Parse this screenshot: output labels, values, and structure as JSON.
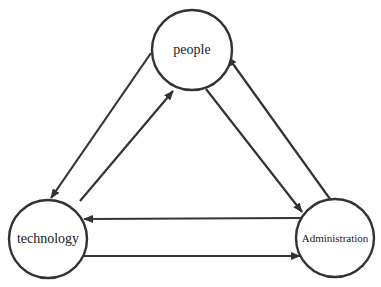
{
  "diagram": {
    "type": "cycle-triangle",
    "colors": {
      "stroke": "#333333",
      "background": "#ffffff",
      "text": "#222222"
    },
    "nodes": [
      {
        "id": "people",
        "label": "people",
        "cx": 192,
        "cy": 50,
        "r": 40,
        "font_size": 14
      },
      {
        "id": "technology",
        "label": "technology",
        "cx": 48,
        "cy": 239,
        "r": 39,
        "font_size": 14
      },
      {
        "id": "administration",
        "label": "Administration",
        "cx": 335,
        "cy": 238,
        "r": 39,
        "font_size": 11
      }
    ],
    "edges": [
      {
        "from": "people",
        "to": "technology",
        "x1": 151,
        "y1": 53,
        "x2": 51,
        "y2": 198
      },
      {
        "from": "technology",
        "to": "people",
        "x1": 80,
        "y1": 201,
        "x2": 173,
        "y2": 91
      },
      {
        "from": "people",
        "to": "administration",
        "x1": 206,
        "y1": 89,
        "x2": 302,
        "y2": 212
      },
      {
        "from": "administration",
        "to": "people",
        "x1": 330,
        "y1": 199,
        "x2": 228,
        "y2": 57
      },
      {
        "from": "administration",
        "to": "technology",
        "x1": 301,
        "y1": 218,
        "x2": 84,
        "y2": 219
      },
      {
        "from": "technology",
        "to": "administration",
        "x1": 84,
        "y1": 256,
        "x2": 300,
        "y2": 256
      }
    ]
  }
}
